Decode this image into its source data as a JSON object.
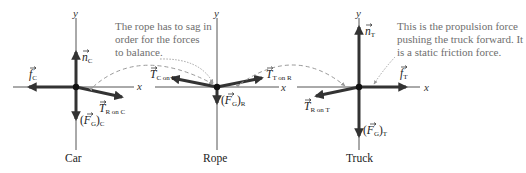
{
  "figure": {
    "type": "free-body diagrams",
    "colors": {
      "background": "#ffffff",
      "axis": "#555555",
      "vector": "#333333",
      "annotation_text": "#6e6e6e",
      "dashed_link": "#888888"
    },
    "annotations": {
      "rope_note": [
        "The rope has to sag in",
        "order for the forces",
        "to balance."
      ],
      "truck_note": [
        "This is the propulsion force",
        "pushing the truck forward. It",
        "is a static friction force."
      ]
    },
    "axes_labels": {
      "x": "x",
      "y": "y"
    },
    "diagrams": [
      {
        "name": "Car",
        "caption": "Car",
        "vectors": [
          {
            "symbol": "n",
            "subscript": "C",
            "direction": "up"
          },
          {
            "symbol": "f",
            "subscript": "C",
            "direction": "left"
          },
          {
            "symbol": "T",
            "subscript": "R on C",
            "direction": "right-down"
          },
          {
            "symbol": "(F_G)",
            "subscript": "C",
            "direction": "down"
          }
        ]
      },
      {
        "name": "Rope",
        "caption": "Rope",
        "vectors": [
          {
            "symbol": "T",
            "subscript": "C on R",
            "direction": "left-up"
          },
          {
            "symbol": "T",
            "subscript": "T on R",
            "direction": "right-up"
          },
          {
            "symbol": "(F_G)",
            "subscript": "R",
            "direction": "down"
          }
        ]
      },
      {
        "name": "Truck",
        "caption": "Truck",
        "vectors": [
          {
            "symbol": "n",
            "subscript": "T",
            "direction": "up"
          },
          {
            "symbol": "f",
            "subscript": "T",
            "direction": "right"
          },
          {
            "symbol": "T",
            "subscript": "R on T",
            "direction": "left-down"
          },
          {
            "symbol": "(F_G)",
            "subscript": "T",
            "direction": "down"
          }
        ]
      }
    ],
    "labels": {
      "n_C": "n",
      "n_C_sub": "C",
      "f_C": "f",
      "f_C_sub": "C",
      "T_RonC": "T",
      "T_RonC_sub": "R on C",
      "FG_C_open": "(",
      "FG_C": "F",
      "FG_C_sub_G": "G",
      "FG_C_close": ")",
      "FG_C_sub": "C",
      "T_ConR": "T",
      "T_ConR_sub": "C on R",
      "T_TonR": "T",
      "T_TonR_sub": "T on R",
      "FG_R_open": "(",
      "FG_R": "F",
      "FG_R_sub_G": "G",
      "FG_R_close": ")",
      "FG_R_sub": "R",
      "n_T": "n",
      "n_T_sub": "T",
      "f_T": "f",
      "f_T_sub": "T",
      "T_RonT": "T",
      "T_RonT_sub": "R on T",
      "FG_T_open": "(",
      "FG_T": "F",
      "FG_T_sub_G": "G",
      "FG_T_close": ")",
      "FG_T_sub": "T"
    },
    "vector_arrow": "→"
  }
}
